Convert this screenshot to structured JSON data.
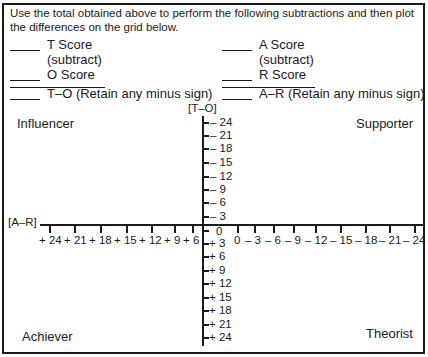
{
  "instructions": "Use the total obtained above to perform the following subtractions and then plot the differences on the grid below.",
  "left_column": {
    "line1": "T Score",
    "line1_sub": "(subtract)",
    "line2": "O Score",
    "result": "T–O (Retain any minus sign)"
  },
  "right_column": {
    "line1": "A Score",
    "line1_sub": "(subtract)",
    "line2": "R Score",
    "result": "A–R (Retain any minus sign)"
  },
  "grid": {
    "y_axis_label": "[T–O]",
    "x_axis_label": "[A–R]",
    "quadrants": {
      "top_left": "Influencer",
      "top_right": "Supporter",
      "bottom_left": "Achiever",
      "bottom_right": "Theorist"
    },
    "y_ticks_top": [
      "– 24",
      "– 21",
      "– 18",
      "– 15",
      "– 12",
      "– 9",
      "– 6",
      "– 3"
    ],
    "y_zero": "0",
    "y_ticks_bottom": [
      "+ 3",
      "+ 6",
      "+ 9",
      "+ 12",
      "+ 15",
      "+ 18",
      "+ 21",
      "+ 24"
    ],
    "x_ticks_left": [
      "+ 24",
      "+ 21",
      "+ 18",
      "+ 15",
      "+ 12",
      "+ 9",
      "+ 6"
    ],
    "x_ticks_right": [
      "0",
      "– 3",
      "– 6",
      "– 9",
      "– 12",
      "– 15",
      "– 18",
      "– 21",
      "– 24"
    ]
  }
}
